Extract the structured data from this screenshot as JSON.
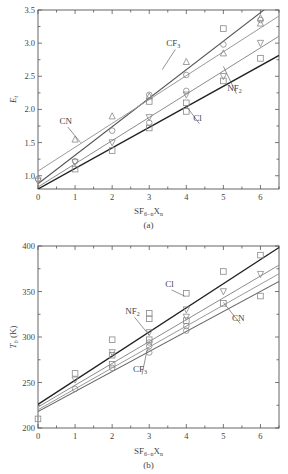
{
  "chart_data": [
    {
      "type": "scatter",
      "panel_label": "(a)",
      "title": "",
      "xlabel": "SF6-nXn",
      "xlabel_parts": {
        "base": "SF",
        "sub1": "6−n",
        "mid": "X",
        "sub2": "n"
      },
      "ylabel": "Et",
      "ylabel_parts": {
        "base": "E",
        "sub": "t"
      },
      "xlim": [
        0,
        6.5
      ],
      "ylim": [
        0.8,
        3.5
      ],
      "xticks": [
        0,
        1,
        2,
        3,
        4,
        5,
        6
      ],
      "yticks": [
        1.0,
        1.5,
        2.0,
        2.5,
        3.0,
        3.5
      ],
      "ytick_labels": [
        "1.0",
        "1.5",
        "2.0",
        "2.5",
        "3.0",
        "3.5"
      ],
      "grid": false,
      "series": [
        {
          "name": "CF3",
          "label_base": "CF",
          "label_sub": "3",
          "marker": "circle",
          "line_color": "#555555",
          "line_width": 1.1,
          "x": [
            0,
            1,
            2,
            3,
            4,
            5,
            6
          ],
          "y": [
            0.95,
            1.22,
            1.68,
            2.22,
            2.52,
            2.98,
            3.35
          ],
          "fit": {
            "intercept": 0.88,
            "slope": 0.43
          },
          "annotation": {
            "x": 3.65,
            "y": 2.95,
            "line_to": [
              3.35,
              2.6
            ]
          }
        },
        {
          "name": "CN",
          "label_base": "CN",
          "label_sub": "",
          "marker": "triangle-up",
          "line_color": "#9a9a9a",
          "line_width": 1.0,
          "x": [
            1,
            2,
            3,
            4,
            5,
            6
          ],
          "y": [
            1.55,
            1.9,
            2.2,
            2.72,
            2.85,
            3.3
          ],
          "fit": {
            "intercept": 1.07,
            "slope": 0.36
          },
          "annotation": {
            "x": 0.75,
            "y": 1.78,
            "line_to": [
              1.15,
              1.5
            ]
          }
        },
        {
          "name": "NF2",
          "label_base": "NF",
          "label_sub": "2",
          "marker": "triangle-down",
          "line_color": "#8c8c8c",
          "line_width": 1.0,
          "x": [
            0,
            1,
            2,
            3,
            4,
            5,
            6
          ],
          "y": [
            0.92,
            1.2,
            1.5,
            1.88,
            2.22,
            2.5,
            3.0
          ],
          "fit": {
            "intercept": 0.83,
            "slope": 0.35
          },
          "annotation": {
            "x": 5.3,
            "y": 2.28,
            "line_to": [
              5.0,
              2.65
            ]
          }
        },
        {
          "name": "Cl",
          "label_base": "Cl",
          "label_sub": "",
          "marker": "square",
          "line_color": "#222222",
          "line_width": 1.4,
          "x": [
            1,
            2,
            3,
            4,
            5,
            6
          ],
          "y": [
            1.1,
            1.38,
            1.72,
            1.97,
            2.43,
            2.77
          ],
          "fit": {
            "intercept": 0.8,
            "slope": 0.31
          },
          "annotation": {
            "x": 4.3,
            "y": 1.83,
            "line_to": [
              4.0,
              2.05
            ]
          }
        }
      ],
      "extra_points": [
        {
          "x": 3,
          "y": 1.8,
          "marker": "circle"
        },
        {
          "x": 3,
          "y": 2.12,
          "marker": "square"
        },
        {
          "x": 4,
          "y": 2.1,
          "marker": "square"
        },
        {
          "x": 4,
          "y": 2.28,
          "marker": "circle"
        },
        {
          "x": 5,
          "y": 3.22,
          "marker": "square"
        },
        {
          "x": 6,
          "y": 3.38,
          "marker": "triangle-up"
        }
      ]
    },
    {
      "type": "scatter",
      "panel_label": "(b)",
      "title": "",
      "xlabel": "SF6-nXn",
      "xlabel_parts": {
        "base": "SF",
        "sub1": "6−n",
        "mid": "X",
        "sub2": "n"
      },
      "ylabel": "Tb (K)",
      "ylabel_parts": {
        "base": "T",
        "sub": "b",
        "unit": " (K)"
      },
      "xlim": [
        0,
        6.5
      ],
      "ylim": [
        200,
        400
      ],
      "xticks": [
        0,
        1,
        2,
        3,
        4,
        5,
        6
      ],
      "yticks": [
        200,
        250,
        300,
        350,
        400
      ],
      "ytick_labels": [
        "200",
        "250",
        "300",
        "350",
        "400"
      ],
      "grid": false,
      "series": [
        {
          "name": "Cl",
          "label_base": "Cl",
          "label_sub": "",
          "marker": "square",
          "line_color": "#222222",
          "line_width": 1.3,
          "x": [
            0,
            1,
            2,
            3,
            3,
            4,
            5,
            6
          ],
          "y": [
            210,
            260,
            297,
            326,
            320,
            348,
            372,
            390
          ],
          "fit": {
            "intercept": 226,
            "slope": 26.5
          },
          "annotation": {
            "x": 3.55,
            "y": 355,
            "line_to": [
              3.95,
              345
            ]
          }
        },
        {
          "name": "NF2",
          "label_base": "NF",
          "label_sub": "2",
          "marker": "triangle-down",
          "line_color": "#8c8c8c",
          "line_width": 1.0,
          "x": [
            1,
            2,
            3,
            4,
            5,
            6
          ],
          "y": [
            253,
            283,
            305,
            330,
            350,
            369
          ],
          "fit": {
            "intercept": 223,
            "slope": 24.0
          },
          "annotation": {
            "x": 2.55,
            "y": 325,
            "line_to": [
              3.0,
              302
            ]
          }
        },
        {
          "name": "CN",
          "label_base": "CN",
          "label_sub": "",
          "marker": "square-open",
          "line_color": "#9a9a9a",
          "line_width": 1.0,
          "x": [
            2,
            3,
            4,
            5,
            6
          ],
          "y": [
            270,
            297,
            318,
            337,
            345
          ],
          "fit": {
            "intercept": 220,
            "slope": 23.0
          },
          "annotation": {
            "x": 5.4,
            "y": 318,
            "line_to": [
              5.0,
              338
            ]
          }
        },
        {
          "name": "CF3",
          "label_base": "CF",
          "label_sub": "3",
          "marker": "circle",
          "line_color": "#666666",
          "line_width": 1.1,
          "x": [
            1,
            2,
            3,
            4
          ],
          "y": [
            243,
            266,
            283,
            307
          ],
          "fit": {
            "intercept": 218,
            "slope": 22.0
          },
          "annotation": {
            "x": 2.75,
            "y": 262,
            "line_to": [
              2.95,
              287
            ]
          }
        }
      ],
      "extra_points": [
        {
          "x": 2,
          "y": 280,
          "marker": "square"
        },
        {
          "x": 3,
          "y": 290,
          "marker": "circle"
        },
        {
          "x": 3,
          "y": 294,
          "marker": "circle"
        },
        {
          "x": 4,
          "y": 312,
          "marker": "circle"
        },
        {
          "x": 4,
          "y": 322,
          "marker": "triangle-down"
        }
      ]
    }
  ]
}
